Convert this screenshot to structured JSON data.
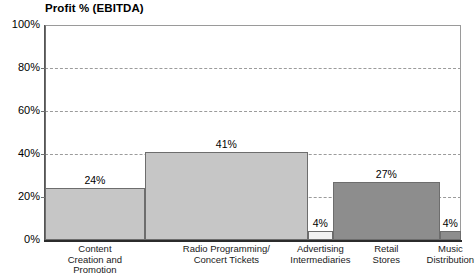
{
  "chart_data": {
    "type": "bar",
    "title": "Profit % (EBITDA)",
    "xlabel": "",
    "ylabel": "",
    "ylim": [
      0,
      100
    ],
    "grid": true,
    "legend": "none",
    "note": "Variable-width contiguous bars (Marimekko-style width); widths reflect relative share along the x-axis.",
    "categories": [
      "Content\nCreation and\nPromotion",
      "Radio Programming/\nConcert Tickets",
      "Advertising\nIntermediaries",
      "Retail\nStores",
      "Music\nDistribution"
    ],
    "values": [
      24,
      41,
      4,
      27,
      4
    ],
    "value_labels": [
      "24%",
      "41%",
      "4%",
      "27%",
      "4%"
    ],
    "bar_colors": [
      "#c6c6c6",
      "#c6c6c6",
      "#f2f2f2",
      "#8d8d8d",
      "#8d8d8d"
    ],
    "bar_widths_pct": [
      24.0,
      39.2,
      6.0,
      25.7,
      5.1
    ],
    "yticks": [
      0,
      20,
      40,
      60,
      80,
      100
    ],
    "ytick_labels": [
      "0%",
      "20%",
      "40%",
      "60%",
      "80%",
      "100%"
    ]
  },
  "style": {
    "axis_color": "#555555",
    "grid_color": "#9b9b9b",
    "bar_border": "#6d6d6d",
    "text_color": "#000000"
  }
}
